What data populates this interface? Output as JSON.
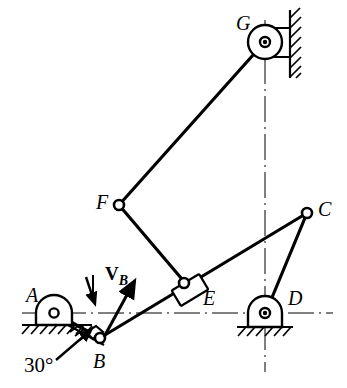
{
  "figure": {
    "type": "kinematic-linkage-diagram",
    "width": 347,
    "height": 388,
    "background_color": "#ffffff",
    "line_color": "#000000"
  },
  "labels": {
    "A": "A",
    "B": "B",
    "C": "C",
    "D": "D",
    "E": "E",
    "F": "F",
    "G": "G",
    "angle": "30°",
    "velocity_v": "V",
    "velocity_sub": "B"
  },
  "joints": [
    {
      "id": "A",
      "label": "A",
      "x": 54,
      "y": 313,
      "kind": "fixed-pin-support-ground"
    },
    {
      "id": "B",
      "label": "B",
      "x": 100,
      "y": 338,
      "kind": "slider-pin-on-incline"
    },
    {
      "id": "E",
      "label": "E",
      "x": 187,
      "y": 285,
      "kind": "slider-block-pin"
    },
    {
      "id": "F",
      "label": "F",
      "x": 119,
      "y": 205,
      "kind": "pin"
    },
    {
      "id": "G",
      "label": "G",
      "x": 265,
      "y": 42,
      "kind": "fixed-pin-support-wall"
    },
    {
      "id": "C",
      "label": "C",
      "x": 307,
      "y": 213,
      "kind": "pin"
    },
    {
      "id": "D",
      "label": "D",
      "x": 265,
      "y": 313,
      "kind": "fixed-pin-support-ground"
    }
  ],
  "links": [
    {
      "from": "A",
      "to": "B"
    },
    {
      "from": "B",
      "to": "C"
    },
    {
      "from": "F",
      "to": "G"
    },
    {
      "from": "F",
      "to": "E"
    },
    {
      "from": "C",
      "to": "D"
    }
  ],
  "centerlines": [
    {
      "id": "horizontal",
      "orientation": "horizontal",
      "y": 313,
      "x1": 22,
      "x2": 333
    },
    {
      "id": "vertical",
      "orientation": "vertical",
      "x": 265,
      "y1": 20,
      "y2": 372
    }
  ],
  "annotations": {
    "angle_value": "30°",
    "angle_description": "inclination of the slider guide surface at B",
    "velocity_label": "V_B",
    "velocity_description": "velocity vector of point B, directed up and to the right"
  }
}
